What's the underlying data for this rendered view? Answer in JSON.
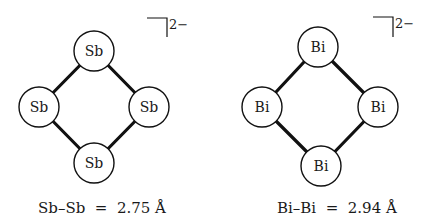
{
  "figure": {
    "ions": [
      {
        "name": "Sb4 dianion",
        "atoms": [
          {
            "label": "Sb",
            "cx": 94,
            "cy": 51
          },
          {
            "label": "Sb",
            "cx": 39,
            "cy": 107
          },
          {
            "label": "Sb",
            "cx": 149,
            "cy": 107
          },
          {
            "label": "Sb",
            "cx": 94,
            "cy": 163
          }
        ],
        "charge": "2−",
        "caption": "Sb–Sb  =  2.75 Å"
      },
      {
        "name": "Bi4 dianion",
        "atoms": [
          {
            "label": "Bi",
            "cx": 318,
            "cy": 47
          },
          {
            "label": "Bi",
            "cx": 262,
            "cy": 107
          },
          {
            "label": "Bi",
            "cx": 378,
            "cy": 107
          },
          {
            "label": "Bi",
            "cx": 321,
            "cy": 166
          }
        ],
        "charge": "2−",
        "caption": "Bi–Bi  =  2.94 Å"
      }
    ]
  }
}
